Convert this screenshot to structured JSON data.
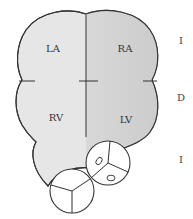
{
  "diagram": {
    "chambers": [
      {
        "id": "LA",
        "label": "LA",
        "x": 53,
        "y": 52
      },
      {
        "id": "RA",
        "label": "RA",
        "x": 125,
        "y": 52
      },
      {
        "id": "RV",
        "label": "RV",
        "x": 56,
        "y": 121
      },
      {
        "id": "LV",
        "label": "LV",
        "x": 126,
        "y": 123
      }
    ],
    "side_labels": [
      {
        "label": "I",
        "y": 44
      },
      {
        "label": "D",
        "y": 101
      },
      {
        "label": "I",
        "y": 163
      }
    ],
    "colors": {
      "left_fill": "#e6e6e6",
      "right_fill": "#d3d3d3",
      "outline": "#333333",
      "valve_fill": "#ffffff"
    }
  }
}
